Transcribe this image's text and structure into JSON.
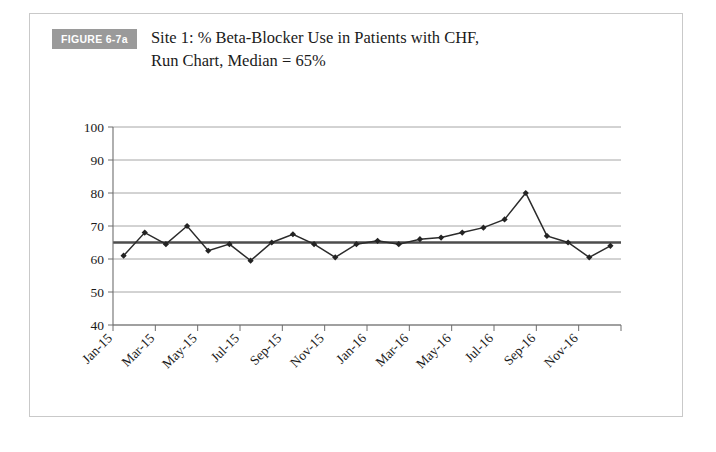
{
  "figure": {
    "badge_label": "FIGURE 6-7a",
    "caption": "Site 1: % Beta-Blocker Use in Patients with CHF,\nRun Chart, Median = 65%"
  },
  "chart_data": {
    "type": "line",
    "title": "Site 1: % Beta-Blocker Use in Patients with CHF, Run Chart, Median = 65%",
    "xlabel": "",
    "ylabel": "",
    "ylim": [
      40,
      100
    ],
    "yticks": [
      40,
      50,
      60,
      70,
      80,
      90,
      100
    ],
    "ytick_labels": [
      "40",
      "50",
      "60",
      "70",
      "80",
      "90",
      "100"
    ],
    "grid": true,
    "legend": "none",
    "x": [
      "Jan-15",
      "Feb-15",
      "Mar-15",
      "Apr-15",
      "May-15",
      "Jun-15",
      "Jul-15",
      "Aug-15",
      "Sep-15",
      "Oct-15",
      "Nov-15",
      "Dec-15",
      "Jan-16",
      "Feb-16",
      "Mar-16",
      "Apr-16",
      "May-16",
      "Jun-16",
      "Jul-16",
      "Aug-16",
      "Sep-16",
      "Oct-16",
      "Nov-16",
      "Dec-16"
    ],
    "xtick_labels": [
      "Jan-15",
      "Mar-15",
      "May-15",
      "Jul-15",
      "Sep-15",
      "Nov-15",
      "Jan-16",
      "Mar-16",
      "May-16",
      "Jul-16",
      "Sep-16",
      "Nov-16"
    ],
    "series": [
      {
        "name": "% Beta-Blocker Use",
        "values": [
          61,
          68,
          64.5,
          70,
          62.5,
          64.5,
          59.5,
          65,
          67.5,
          64.5,
          60.5,
          64.5,
          65.5,
          64.5,
          66,
          66.5,
          68,
          69.5,
          72,
          80,
          67,
          65,
          60.5,
          64
        ],
        "color": "#232323",
        "marker": "diamond"
      }
    ],
    "reference_lines": [
      {
        "name": "median",
        "value": 65,
        "label": "Median = 65%",
        "color": "#4d4d4d"
      }
    ]
  }
}
